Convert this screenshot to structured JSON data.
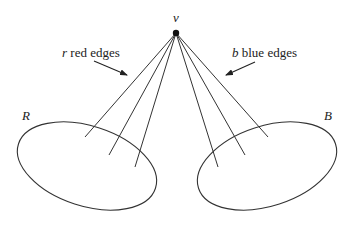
{
  "diagram": {
    "vertex": {
      "label": "v",
      "x": 176,
      "y": 33
    },
    "left_set": {
      "label": "R",
      "cx": 87,
      "cy": 166,
      "rx": 72,
      "ry": 40,
      "angle": 18
    },
    "right_set": {
      "label": "B",
      "cx": 267,
      "cy": 166,
      "rx": 72,
      "ry": 40,
      "angle": -18
    },
    "left_annotation": {
      "var": "r",
      "text": " red edges"
    },
    "right_annotation": {
      "var": "b",
      "text": " blue edges"
    },
    "red_edges": [
      {
        "x2": 85,
        "y2": 137
      },
      {
        "x2": 109,
        "y2": 155
      },
      {
        "x2": 135,
        "y2": 167
      }
    ],
    "blue_edges": [
      {
        "x2": 218,
        "y2": 167
      },
      {
        "x2": 245,
        "y2": 155
      },
      {
        "x2": 268,
        "y2": 137
      }
    ],
    "colors": {
      "line": "#333333",
      "background": "#ffffff"
    }
  }
}
